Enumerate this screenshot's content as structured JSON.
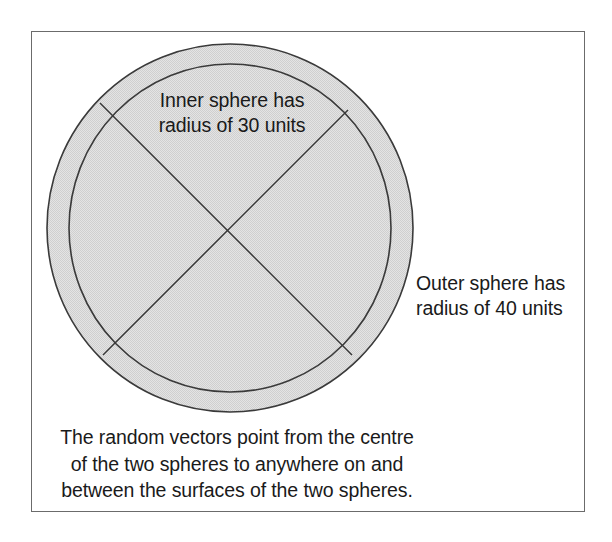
{
  "figure": {
    "background_color": "#ffffff",
    "frame_color": "#6b6b6b",
    "shell_fill_color": "#dcdcdc",
    "stroke_color": "#3a3a3a",
    "text_color": "#1a1a1a"
  },
  "labels": {
    "inner_sphere": "Inner sphere has\nradius of 30 units",
    "inner_sphere_line1": "Inner sphere has",
    "inner_sphere_line2": "radius of 30 units",
    "outer_sphere": "Outer sphere has\nradius of 40 units",
    "outer_sphere_line1": "Outer sphere has",
    "outer_sphere_line2": "radius of 40 units",
    "caption": "The random vectors point from the centre\nof the two spheres to anywhere on and\nbetween the surfaces of the two spheres.",
    "caption_line1": "The random vectors point from the centre",
    "caption_line2": "of the two spheres to anywhere on and",
    "caption_line3": "between the surfaces of the two spheres."
  },
  "geometry": {
    "center_x": 230,
    "center_y": 228,
    "outer_radius_x": 183,
    "outer_radius_y": 184,
    "inner_radius_x": 161,
    "inner_radius_y": 164,
    "inner_radius_units": 30,
    "outer_radius_units": 40,
    "diagonal_endpoints": [
      [
        100,
        103
      ],
      [
        352,
        355
      ],
      [
        348,
        110
      ],
      [
        103,
        355
      ]
    ]
  }
}
